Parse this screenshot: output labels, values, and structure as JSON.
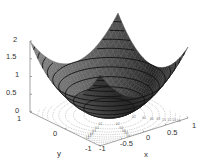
{
  "chart_data": {
    "type": "surface3d",
    "title": "",
    "function": "z = x^2 + y^2",
    "xlabel": "x",
    "ylabel": "y",
    "zlabel": "",
    "xlim": [
      -1,
      1
    ],
    "ylim": [
      -1,
      1
    ],
    "zlim": [
      0,
      2
    ],
    "x_ticks": [
      "-1",
      "-0.5",
      "0",
      "0.5",
      "1"
    ],
    "y_ticks": [
      "-1",
      "0",
      "1"
    ],
    "z_ticks": [
      "0",
      "0.5",
      "1",
      "1.5",
      "2"
    ],
    "surface_contour_levels": [
      0.2,
      0.4,
      0.6,
      0.8,
      1.0,
      1.2,
      1.4,
      1.6,
      1.8
    ],
    "floor_contour_levels": [
      0.2,
      0.4,
      0.6,
      0.8,
      1.0,
      1.2,
      1.4,
      1.6,
      1.8
    ],
    "floor_contour_style": "dotted with labels",
    "colormap": "grayscale",
    "grid": false,
    "legend": "none",
    "colors": {
      "surface_dark": "#2a2a2a",
      "surface_light": "#9a9a9a",
      "contour_line": "#111111",
      "axis": "#666666",
      "floor_contour": "#888888"
    }
  }
}
